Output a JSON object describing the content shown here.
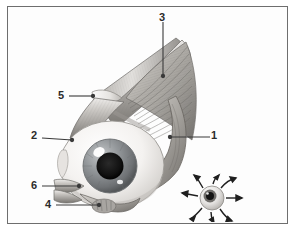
{
  "figure": {
    "kind": "anatomical-illustration",
    "style": "grayscale medical drawing",
    "border_color": "#6e6e6e",
    "background_color": "#ffffff"
  },
  "labels": [
    {
      "id": "label-1",
      "text": "1",
      "x": 213,
      "y": 131,
      "leader": {
        "from_x": 211,
        "from_y": 137,
        "to_x": 170,
        "to_y": 137
      },
      "points_to": "lateral rectus muscle / optic nerve region"
    },
    {
      "id": "label-2",
      "text": "2",
      "x": 33,
      "y": 131,
      "leader": {
        "from_x": 42,
        "from_y": 137,
        "to_x": 72,
        "to_y": 140
      },
      "points_to": "anterior globe / sclera edge"
    },
    {
      "id": "label-3",
      "text": "3",
      "x": 158,
      "y": 14,
      "leader": {
        "from_x": 162,
        "from_y": 22,
        "to_x": 162,
        "to_y": 75
      },
      "points_to": "superior rectus muscle"
    },
    {
      "id": "label-4",
      "text": "4",
      "x": 47,
      "y": 200,
      "leader": {
        "from_x": 56,
        "from_y": 205,
        "to_x": 98,
        "to_y": 205
      },
      "points_to": "inferior oblique muscle"
    },
    {
      "id": "label-5",
      "text": "5",
      "x": 60,
      "y": 90,
      "leader": {
        "from_x": 69,
        "from_y": 96,
        "to_x": 94,
        "to_y": 96
      },
      "points_to": "superior oblique tendon / trochlea"
    },
    {
      "id": "label-6",
      "text": "6",
      "x": 33,
      "y": 180,
      "leader": {
        "from_x": 42,
        "from_y": 186,
        "to_x": 78,
        "to_y": 186
      },
      "points_to": "medial rectus muscle"
    }
  ],
  "eyeball": {
    "iris_color": "#8d9194",
    "pupil_color": "#1a1a1a",
    "sclera_color": "#f2f0ee",
    "highlight_color": "#ffffff"
  },
  "muscles": {
    "fill_light": "#d9d7d4",
    "fill_mid": "#a9a6a2",
    "fill_dark": "#6b6966",
    "stripe_color": "#7d7b78"
  },
  "inset_diagram": {
    "id": "gaze-direction-inset",
    "description": "small eye with eight radiating arrows showing directions of gaze",
    "center_x": 212,
    "center_y": 198,
    "arrow_count": 8,
    "arrow_color": "#1f1f1f",
    "eye_color": "#cfcdcb"
  }
}
